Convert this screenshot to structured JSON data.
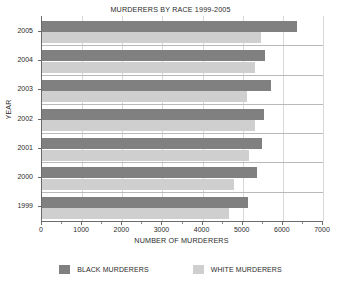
{
  "chart_data": {
    "type": "bar",
    "orientation": "horizontal",
    "title": "MURDERERS BY RACE 1999-2005",
    "xlabel": "NUMBER OF MURDERERS",
    "ylabel": "YEAR",
    "categories": [
      "2005",
      "2004",
      "2003",
      "2002",
      "2001",
      "2000",
      "1999"
    ],
    "series": [
      {
        "name": "BLACK MURDERERS",
        "color": "#808080",
        "values": [
          6350,
          5550,
          5700,
          5530,
          5480,
          5350,
          5130
        ]
      },
      {
        "name": "WHITE MURDERERS",
        "color": "#cfcfcf",
        "values": [
          5450,
          5300,
          5100,
          5300,
          5160,
          4780,
          4670
        ]
      }
    ],
    "xlim": [
      0,
      7000
    ],
    "xticks": [
      0,
      1000,
      2000,
      3000,
      4000,
      5000,
      6000,
      7000
    ],
    "xtick_labels": [
      "0",
      "1000",
      "2000",
      "3000",
      "4000",
      "5000",
      "6000",
      "7000"
    ],
    "grid": true,
    "legend_position": "bottom"
  },
  "legend": {
    "entries": [
      {
        "label": "BLACK MURDERERS",
        "color": "#808080"
      },
      {
        "label": "WHITE MURDERERS",
        "color": "#cfcfcf"
      }
    ]
  },
  "footer": {
    "sliver_text": ""
  }
}
